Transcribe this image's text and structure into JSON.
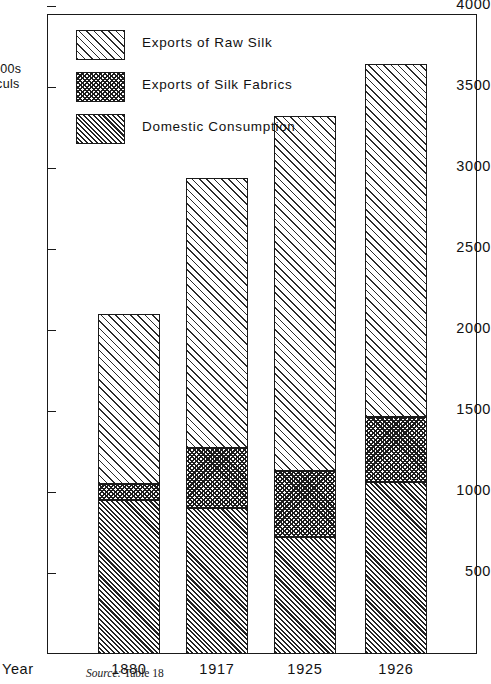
{
  "chart_data": {
    "type": "bar",
    "subtype": "stacked-vertical",
    "title": "",
    "xlabel": "Year",
    "ylabel": "1000s Piculs",
    "ylabel_lines": [
      "000s",
      "iculs"
    ],
    "categories": [
      "1880",
      "1917",
      "1925",
      "1926"
    ],
    "ylim": [
      0,
      4250
    ],
    "yticks": [
      500,
      1000,
      1500,
      2000,
      2500,
      3000,
      3500,
      4000
    ],
    "ytick_labels": [
      "500",
      "1000",
      "1500",
      "2000",
      "2500",
      "3000",
      "3500",
      "4000"
    ],
    "grid": false,
    "legend_position": "upper-left-inside",
    "stack_order_bottom_to_top": [
      "Domestic Consumption",
      "Exports of Silk Fabrics",
      "Exports of Raw Silk"
    ],
    "series": [
      {
        "name": "Domestic Consumption",
        "pattern": "dense-diagonal-hatch",
        "values": [
          950,
          900,
          720,
          1060
        ]
      },
      {
        "name": "Exports of Silk Fabrics",
        "pattern": "crosshatch",
        "values": [
          100,
          370,
          410,
          400
        ]
      },
      {
        "name": "Exports of Raw Silk",
        "pattern": "sparse-diagonal-hatch",
        "values": [
          1050,
          1670,
          2190,
          2180
        ]
      }
    ],
    "totals": [
      2100,
      2940,
      3320,
      3640
    ],
    "cumulative_tops": [
      [
        950,
        1050,
        2100
      ],
      [
        900,
        1270,
        2940
      ],
      [
        720,
        1130,
        3320
      ],
      [
        1060,
        1460,
        3640
      ]
    ]
  },
  "legend": {
    "items": [
      {
        "label": "Exports of Raw Silk",
        "pattern": "sparse-diagonal-hatch"
      },
      {
        "label": "Exports of Silk Fabrics",
        "pattern": "crosshatch"
      },
      {
        "label": "Domestic Consumption",
        "pattern": "dense-diagonal-hatch"
      }
    ]
  },
  "source": {
    "label": "Source:",
    "text": "Table 18"
  },
  "colors": {
    "ink": "#1a1a1a",
    "background": "#ffffff"
  }
}
